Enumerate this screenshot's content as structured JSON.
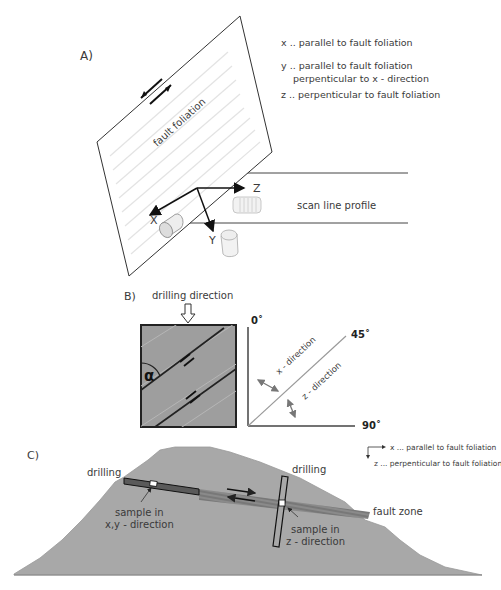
{
  "panel_a": {
    "label": "A)",
    "plane_label": "fault foliation",
    "axes": {
      "x": "X",
      "y": "Y",
      "z": "Z"
    },
    "scan_line_label": "scan line profile",
    "legend": {
      "x": "x .. parallel to fault foliation",
      "y_line1": "y .. parallel to fault foliation",
      "y_line2": "perpenticular to x - direction",
      "z": "z .. perpenticular to fault foliation"
    }
  },
  "panel_b": {
    "label": "B)",
    "drilling_direction": "drilling direction",
    "angle_symbol": "α",
    "angle_0": "0˚",
    "angle_45": "45˚",
    "angle_90": "90˚",
    "x_direction": "x - direction",
    "z_direction": "z - direction"
  },
  "panel_c": {
    "label": "C)",
    "drilling_left": "drilling",
    "drilling_right": "drilling",
    "sample_xy_line1": "sample in",
    "sample_xy_line2": "x,y - direction",
    "sample_z_line1": "sample in",
    "sample_z_line2": "z - direction",
    "fault_zone": "fault zone",
    "legend_x": "x ... parallel to fault foliation",
    "legend_z": "z ... perpenticular to fault foliation"
  },
  "colors": {
    "rock": "#a9a9a9",
    "box_fill": "#9e9e9e",
    "line": "#222222",
    "foliation": "#e6e6e6"
  }
}
